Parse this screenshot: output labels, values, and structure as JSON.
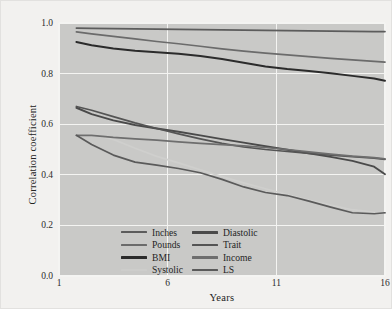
{
  "chart_data": {
    "type": "line",
    "title": "",
    "xlabel": "Years",
    "ylabel": "Correlation coefficient",
    "xlim": [
      1,
      16
    ],
    "ylim": [
      0.0,
      1.0
    ],
    "xticks": [
      "1",
      "6",
      "11",
      "16"
    ],
    "xtick_values": [
      1,
      6,
      11,
      16
    ],
    "yticks": [
      "0.0",
      "0.2",
      "0.4",
      "0.6",
      "0.8",
      "1.0"
    ],
    "ytick_values": [
      0.0,
      0.2,
      0.4,
      0.6,
      0.8,
      1.0
    ],
    "grid": "white gridlines on both axes",
    "legend_position": "lower-left inside plot",
    "plot_background": "#c9c9c7",
    "figure_background": "#f2f1ef",
    "x": [
      1.8,
      2.5,
      3.5,
      4.5,
      5.5,
      6.5,
      7.5,
      8.5,
      9.5,
      10.5,
      11.5,
      12.5,
      13.5,
      14.5,
      15.5,
      16
    ],
    "series": [
      {
        "name": "Inches",
        "color": "#5c5c5c",
        "width": 1.7,
        "values": [
          0.98,
          0.979,
          0.978,
          0.977,
          0.976,
          0.975,
          0.974,
          0.973,
          0.972,
          0.971,
          0.97,
          0.969,
          0.968,
          0.967,
          0.966,
          0.966
        ]
      },
      {
        "name": "Pounds",
        "color": "#6b6b6b",
        "width": 1.7,
        "values": [
          0.965,
          0.957,
          0.947,
          0.937,
          0.927,
          0.918,
          0.908,
          0.898,
          0.889,
          0.881,
          0.874,
          0.867,
          0.86,
          0.854,
          0.848,
          0.845
        ]
      },
      {
        "name": "BMI",
        "color": "#2b2b2b",
        "width": 2.0,
        "values": [
          0.925,
          0.912,
          0.899,
          0.89,
          0.884,
          0.878,
          0.87,
          0.858,
          0.843,
          0.828,
          0.818,
          0.81,
          0.801,
          0.791,
          0.781,
          0.772
        ]
      },
      {
        "name": "Systolic",
        "color": "#cfcfcd",
        "width": 1.7,
        "values": [
          0.555,
          0.56,
          0.54,
          0.505,
          0.473,
          0.447,
          0.42,
          0.393,
          0.368,
          0.345,
          0.322,
          0.3,
          0.28,
          0.262,
          0.252,
          0.25
        ]
      },
      {
        "name": "Diastolic",
        "color": "#4a4a4a",
        "width": 1.9,
        "values": [
          0.665,
          0.64,
          0.615,
          0.597,
          0.583,
          0.57,
          0.556,
          0.541,
          0.527,
          0.513,
          0.499,
          0.485,
          0.471,
          0.455,
          0.432,
          0.402
        ]
      },
      {
        "name": "Trait",
        "color": "#545454",
        "width": 1.7,
        "values": [
          0.67,
          0.655,
          0.63,
          0.605,
          0.583,
          0.562,
          0.542,
          0.524,
          0.51,
          0.5,
          0.492,
          0.485,
          0.478,
          0.472,
          0.466,
          0.461
        ]
      },
      {
        "name": "Income",
        "color": "#6e6e6e",
        "width": 1.7,
        "values": [
          0.556,
          0.556,
          0.548,
          0.542,
          0.537,
          0.53,
          0.524,
          0.519,
          0.514,
          0.508,
          0.5,
          0.491,
          0.482,
          0.474,
          0.468,
          0.463
        ]
      },
      {
        "name": "LS",
        "color": "#5a5a5a",
        "width": 1.7,
        "values": [
          0.556,
          0.52,
          0.478,
          0.45,
          0.438,
          0.425,
          0.408,
          0.382,
          0.352,
          0.33,
          0.318,
          0.296,
          0.272,
          0.25,
          0.246,
          0.25
        ]
      }
    ]
  },
  "legend": {
    "columns": [
      [
        {
          "label": "Inches",
          "swatch": "#5c5c5c",
          "height": 2.4
        },
        {
          "label": "Pounds",
          "swatch": "#6b6b6b",
          "height": 2.4
        },
        {
          "label": "BMI",
          "swatch": "#2b2b2b",
          "height": 2.8
        },
        {
          "label": "Systolic",
          "swatch": "#cdcdcb",
          "height": 2.4
        }
      ],
      [
        {
          "label": "Diastolic",
          "swatch": "#4a4a4a",
          "height": 2.6
        },
        {
          "label": "Trait",
          "swatch": "#545454",
          "height": 2.4
        },
        {
          "label": "Income",
          "swatch": "#6e6e6e",
          "height": 2.4
        },
        {
          "label": "LS",
          "swatch": "#5a5a5a",
          "height": 2.4
        }
      ]
    ]
  }
}
